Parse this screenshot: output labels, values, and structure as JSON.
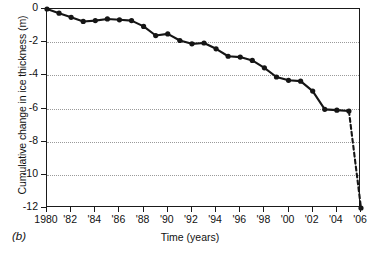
{
  "panel": {
    "label": "(b)"
  },
  "axes": {
    "ylabel": "Cumulative change in ice thickness (m)",
    "xlabel": "Time (years)",
    "yticks": [
      "0",
      "-2",
      "-4",
      "-6",
      "-8",
      "-10",
      "-12"
    ],
    "ytick_values": [
      0,
      -2,
      -4,
      -6,
      -8,
      -10,
      -12
    ],
    "xticks": [
      "1980",
      "'82",
      "'84",
      "'86",
      "'88",
      "'90",
      "'92",
      "'94",
      "'96",
      "'98",
      "'00",
      "'02",
      "'04",
      "'06"
    ],
    "xtick_values": [
      1980,
      1982,
      1984,
      1986,
      1988,
      1990,
      1992,
      1994,
      1996,
      1998,
      2000,
      2002,
      2004,
      2006
    ]
  },
  "chart_data": {
    "type": "line",
    "title": "",
    "xlabel": "Time (years)",
    "ylabel": "Cumulative change in ice thickness (m)",
    "xlim": [
      1980,
      2006
    ],
    "ylim": [
      -12,
      0
    ],
    "grid": "horizontal-dotted",
    "legend": "none",
    "line_color": "#151515",
    "marker": "filled-circle",
    "series": [
      {
        "name": "Cumulative change in ice thickness",
        "x": [
          1980,
          1981,
          1982,
          1983,
          1984,
          1985,
          1986,
          1987,
          1988,
          1989,
          1990,
          1991,
          1992,
          1993,
          1994,
          1995,
          1996,
          1997,
          1998,
          1999,
          2000,
          2001,
          2002,
          2003,
          2004,
          2005,
          2006
        ],
        "values": [
          0.0,
          -0.25,
          -0.5,
          -0.75,
          -0.7,
          -0.6,
          -0.65,
          -0.7,
          -1.05,
          -1.6,
          -1.5,
          -1.9,
          -2.1,
          -2.05,
          -2.4,
          -2.85,
          -2.9,
          -3.1,
          -3.55,
          -4.1,
          -4.3,
          -4.35,
          -4.95,
          -6.05,
          -6.1,
          -6.15,
          -12.0
        ],
        "dashed_from_index": 25,
        "note_dashed": "final segment 2005 to 2006 drawn dashed"
      }
    ]
  }
}
